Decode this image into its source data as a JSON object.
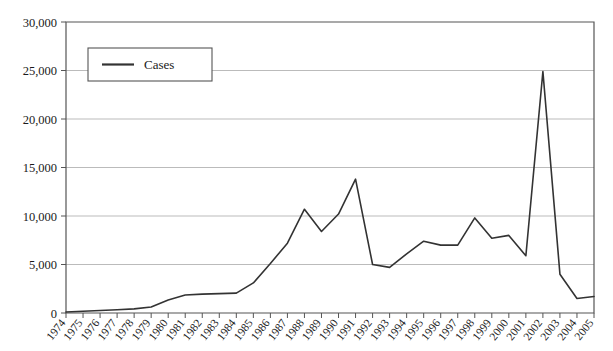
{
  "chart_data": {
    "type": "line",
    "title": "",
    "xlabel": "",
    "ylabel": "",
    "grid": true,
    "legend_position": "top-left",
    "ylim": [
      0,
      30000
    ],
    "ytick_values": [
      0,
      5000,
      10000,
      15000,
      20000,
      25000,
      30000
    ],
    "ytick_labels": [
      "0",
      "5,000",
      "10,000",
      "15,000",
      "20,000",
      "25,000",
      "30,000"
    ],
    "categories": [
      "1974",
      "1975",
      "1976",
      "1977",
      "1978",
      "1979",
      "1980",
      "1981",
      "1982",
      "1983",
      "1984",
      "1985",
      "1986",
      "1987",
      "1988",
      "1989",
      "1990",
      "1991",
      "1992",
      "1993",
      "1994",
      "1995",
      "1996",
      "1997",
      "1998",
      "1999",
      "2000",
      "2001",
      "2002",
      "2003",
      "2004",
      "2005"
    ],
    "series": [
      {
        "name": "Cases",
        "color": "#333333",
        "values": [
          100,
          180,
          260,
          340,
          430,
          620,
          1350,
          1850,
          1950,
          2000,
          2050,
          3100,
          5100,
          7200,
          10700,
          8400,
          10200,
          13800,
          5000,
          4700,
          6100,
          7400,
          7000,
          7000,
          9800,
          7700,
          8000,
          5900,
          24900,
          4000,
          1500,
          1700
        ]
      }
    ],
    "legend": [
      {
        "label": "Cases"
      }
    ]
  },
  "legend_panel": {
    "cases_label": "Cases"
  }
}
